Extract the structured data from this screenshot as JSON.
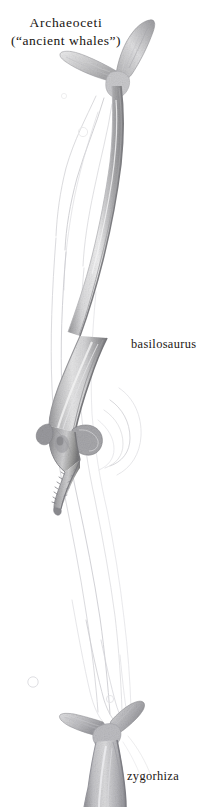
{
  "plate": {
    "width": 221,
    "height": 807,
    "background_color": "#ffffff",
    "medium": "graphite pencil scientific illustration",
    "subject": "Archaeoceti (ancient whales) comparative plate"
  },
  "title": {
    "line1": "Archaeoceti",
    "line2": "(“ancient whales”)"
  },
  "labels": {
    "basilosaurus": "basilosaurus",
    "zygorhiza": "zygorhiza"
  },
  "figures": [
    {
      "name": "basilosaurus",
      "label": "basilosaurus",
      "description": "Fully rendered elongate archaeocete shown vertically, tail fluke uppermost, long slender tail stock curving down to a heavy body, short flipper, and long toothed snout at lower end.",
      "parts": [
        "tail-fluke",
        "tail-stock",
        "trunk",
        "flipper",
        "skull",
        "rostrum",
        "teeth"
      ]
    },
    {
      "name": "zygorhiza",
      "label": "zygorhiza",
      "description": "Second, smaller archaeocete at the bottom of the plate, only its tail fluke and forward-widening body visible, running off the lower edge of the page.",
      "parts": [
        "tail-fluke",
        "tail-stock",
        "body"
      ]
    },
    {
      "name": "ghost-outlines",
      "label": "",
      "description": "Faint unfinished pencil contour lines of a third whale body sweeping down the left and centre of the plate.",
      "parts": [
        "contour-lines",
        "bubbles"
      ]
    }
  ],
  "colors": {
    "paper": "#ffffff",
    "ink": "#16120f",
    "graphite_dark": "#6f6f71",
    "graphite_mid": "#9a9a9c",
    "graphite_light": "#c8c8ca",
    "graphite_faint": "#e2e2e4"
  }
}
